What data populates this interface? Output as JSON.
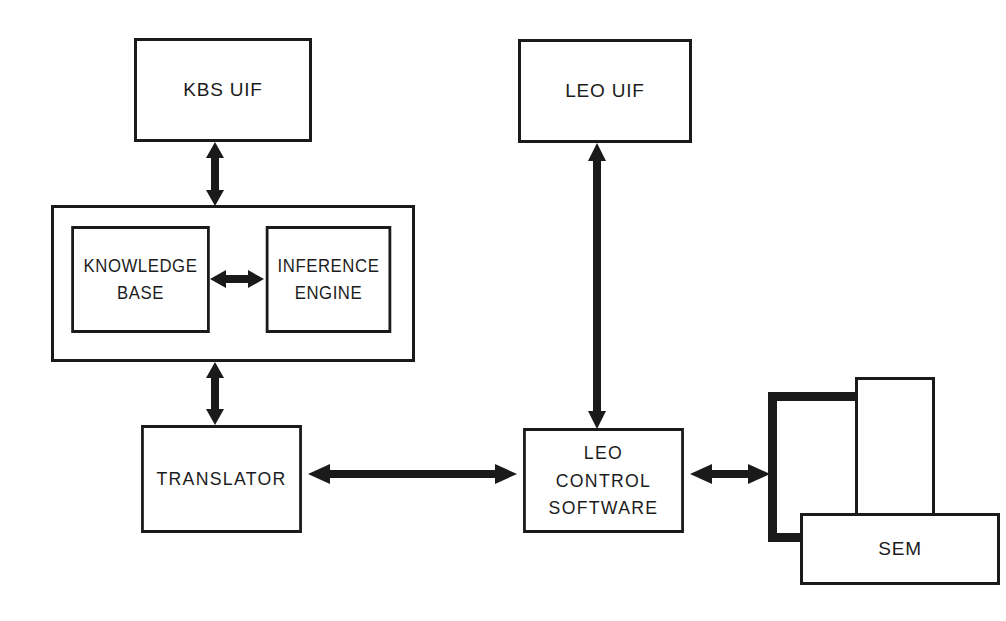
{
  "diagram": {
    "nodes": {
      "kbs_uif": {
        "label": "KBS UIF"
      },
      "kbs_container": {
        "label": ""
      },
      "knowledge_base": {
        "label": "KNOWLEDGE\nBASE"
      },
      "inference_engine": {
        "label": "INFERENCE\nENGINE"
      },
      "translator": {
        "label": "TRANSLATOR"
      },
      "leo_uif": {
        "label": "LEO UIF"
      },
      "leo_control_software": {
        "label": "LEO\nCONTROL\nSOFTWARE"
      },
      "sem": {
        "label": "SEM"
      }
    },
    "connections": [
      {
        "name": "kbs-uif-to-kbs",
        "from": "KBS UIF",
        "to": "KNOWLEDGE BASE / INFERENCE ENGINE",
        "style": "double-headed",
        "orientation": "vertical"
      },
      {
        "name": "knowledge-base-to-inference-engine",
        "from": "KNOWLEDGE BASE",
        "to": "INFERENCE ENGINE",
        "style": "double-headed",
        "orientation": "horizontal"
      },
      {
        "name": "kbs-to-translator",
        "from": "KBS",
        "to": "TRANSLATOR",
        "style": "double-headed",
        "orientation": "vertical"
      },
      {
        "name": "translator-to-leo-control",
        "from": "TRANSLATOR",
        "to": "LEO CONTROL SOFTWARE",
        "style": "double-headed",
        "orientation": "horizontal"
      },
      {
        "name": "leo-control-to-leo-uif",
        "from": "LEO CONTROL SOFTWARE",
        "to": "LEO UIF",
        "style": "double-headed",
        "orientation": "vertical"
      },
      {
        "name": "leo-control-to-sem",
        "from": "LEO CONTROL SOFTWARE",
        "to": "SEM",
        "style": "double-headed",
        "orientation": "horizontal"
      }
    ],
    "colors": {
      "stroke": "#1a1a1a",
      "fill": "#ffffff",
      "text": "#1c1c1c"
    }
  }
}
